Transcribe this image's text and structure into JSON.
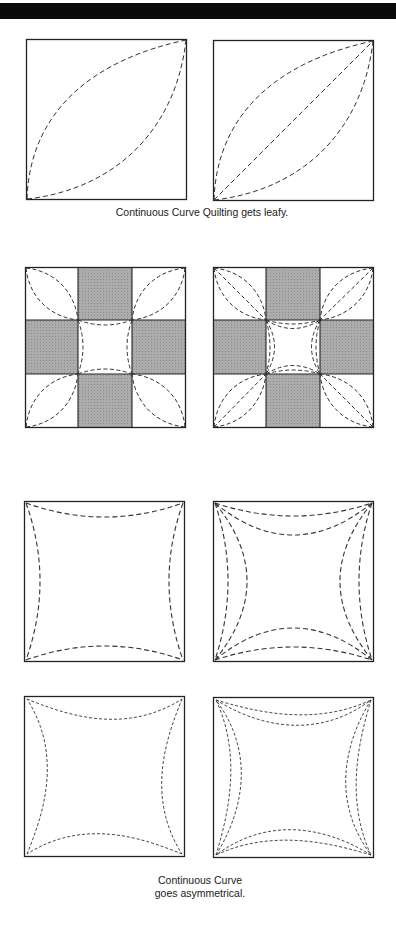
{
  "header_bar": {
    "color": "#0a0a0a"
  },
  "colors": {
    "outline": "#222222",
    "stitch": "#333333",
    "patch_fill": "#a9a9a9",
    "background": "#ffffff"
  },
  "captions": {
    "leafy": "Continuous Curve Quilting gets leafy.",
    "asym_line1": "Continuous Curve",
    "asym_line2": "goes asymmetrical."
  },
  "panels": [
    {
      "id": "leaf-single",
      "description": "Square with one leaf-shaped curve pair from bottom-left to top-right corner"
    },
    {
      "id": "leaf-with-diagonal",
      "description": "Square with leaf-shaped curve pair plus a straight diagonal"
    },
    {
      "id": "nine-patch-leaf",
      "description": "Nine-patch block with leaf curves in corners and arcs in center square"
    },
    {
      "id": "nine-patch-double-leaf",
      "description": "Nine-patch block with double leaf curves plus diagonals in corners and double arcs in center"
    },
    {
      "id": "square-arcs-single",
      "description": "Square with one inward arc on each side"
    },
    {
      "id": "square-arcs-double",
      "description": "Square with two inward arcs on each side"
    },
    {
      "id": "square-asym-single",
      "description": "Square with one asymmetrical inward arc on each side"
    },
    {
      "id": "square-asym-double",
      "description": "Square with two asymmetrical inward arcs on each side"
    }
  ]
}
